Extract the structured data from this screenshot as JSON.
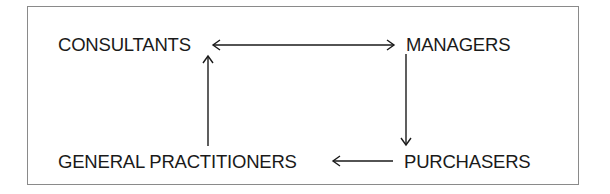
{
  "diagram": {
    "type": "flow",
    "nodes": [
      {
        "id": "consultants",
        "label": "CONSULTANTS"
      },
      {
        "id": "managers",
        "label": "MANAGERS"
      },
      {
        "id": "general_practitioners",
        "label": "GENERAL PRACTITIONERS"
      },
      {
        "id": "purchasers",
        "label": "PURCHASERS"
      }
    ],
    "edges": [
      {
        "from": "consultants",
        "to": "managers",
        "direction": "bidirectional"
      },
      {
        "from": "managers",
        "to": "purchasers",
        "direction": "forward"
      },
      {
        "from": "purchasers",
        "to": "general_practitioners",
        "direction": "forward"
      },
      {
        "from": "general_practitioners",
        "to": "consultants",
        "direction": "forward"
      }
    ]
  },
  "colors": {
    "text": "#1a1a1a",
    "border": "#8a8a8a",
    "background": "#ffffff"
  }
}
